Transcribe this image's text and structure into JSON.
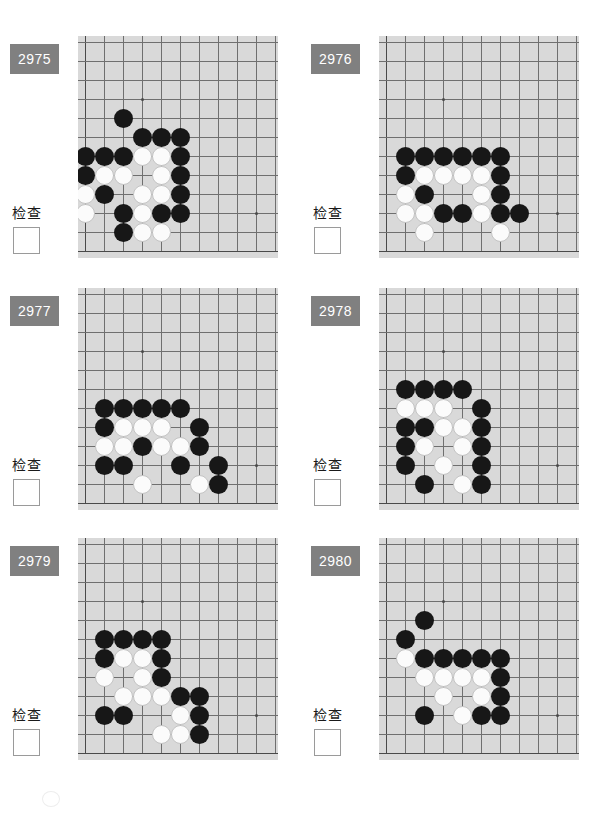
{
  "page": {
    "check_label": "检查",
    "board_bg_color": "#d9d9d9",
    "grid_line_color": "#6f6f6f",
    "badge_color": "#808080",
    "black_stone_color": "#171717",
    "white_stone_color": "#fbfbfb"
  },
  "board_geometry": {
    "columns": 10,
    "rows": 11,
    "cell_size": 19,
    "origin_x": 7,
    "origin_y": 6,
    "hoshi": [
      {
        "col": 3,
        "row": 3
      },
      {
        "col": 9,
        "row": 9
      }
    ],
    "note": "Upper-left corner of a full Go board; col 0 / row 0 are the board edges shown, bottom-left region drawn with the left and bottom boundary lines."
  },
  "problems": [
    {
      "id": "2975",
      "number_label": "2975",
      "check_label": "检查",
      "checkbox_checked": false,
      "stones": [
        {
          "color": "b",
          "col": 2,
          "row": 4
        },
        {
          "color": "b",
          "col": 3,
          "row": 5
        },
        {
          "color": "b",
          "col": 4,
          "row": 5
        },
        {
          "color": "b",
          "col": 5,
          "row": 5
        },
        {
          "color": "b",
          "col": 0,
          "row": 6
        },
        {
          "color": "b",
          "col": 1,
          "row": 6
        },
        {
          "color": "b",
          "col": 2,
          "row": 6
        },
        {
          "color": "w",
          "col": 3,
          "row": 6
        },
        {
          "color": "w",
          "col": 4,
          "row": 6
        },
        {
          "color": "b",
          "col": 5,
          "row": 6
        },
        {
          "color": "b",
          "col": 0,
          "row": 7
        },
        {
          "color": "w",
          "col": 1,
          "row": 7
        },
        {
          "color": "w",
          "col": 2,
          "row": 7
        },
        {
          "color": "w",
          "col": 4,
          "row": 7
        },
        {
          "color": "b",
          "col": 5,
          "row": 7
        },
        {
          "color": "w",
          "col": 0,
          "row": 8
        },
        {
          "color": "b",
          "col": 1,
          "row": 8
        },
        {
          "color": "w",
          "col": 3,
          "row": 8
        },
        {
          "color": "w",
          "col": 4,
          "row": 8
        },
        {
          "color": "b",
          "col": 5,
          "row": 8
        },
        {
          "color": "w",
          "col": 0,
          "row": 9
        },
        {
          "color": "b",
          "col": 2,
          "row": 9
        },
        {
          "color": "w",
          "col": 3,
          "row": 9
        },
        {
          "color": "b",
          "col": 4,
          "row": 9
        },
        {
          "color": "b",
          "col": 5,
          "row": 9
        },
        {
          "color": "b",
          "col": 2,
          "row": 10
        },
        {
          "color": "w",
          "col": 3,
          "row": 10
        },
        {
          "color": "w",
          "col": 4,
          "row": 10
        }
      ]
    },
    {
      "id": "2976",
      "number_label": "2976",
      "check_label": "检查",
      "checkbox_checked": false,
      "stones": [
        {
          "color": "b",
          "col": 1,
          "row": 6
        },
        {
          "color": "b",
          "col": 2,
          "row": 6
        },
        {
          "color": "b",
          "col": 3,
          "row": 6
        },
        {
          "color": "b",
          "col": 4,
          "row": 6
        },
        {
          "color": "b",
          "col": 5,
          "row": 6
        },
        {
          "color": "b",
          "col": 6,
          "row": 6
        },
        {
          "color": "b",
          "col": 1,
          "row": 7
        },
        {
          "color": "w",
          "col": 2,
          "row": 7
        },
        {
          "color": "w",
          "col": 3,
          "row": 7
        },
        {
          "color": "w",
          "col": 4,
          "row": 7
        },
        {
          "color": "w",
          "col": 5,
          "row": 7
        },
        {
          "color": "b",
          "col": 6,
          "row": 7
        },
        {
          "color": "w",
          "col": 1,
          "row": 8
        },
        {
          "color": "b",
          "col": 2,
          "row": 8
        },
        {
          "color": "w",
          "col": 5,
          "row": 8
        },
        {
          "color": "b",
          "col": 6,
          "row": 8
        },
        {
          "color": "w",
          "col": 1,
          "row": 9
        },
        {
          "color": "w",
          "col": 2,
          "row": 9
        },
        {
          "color": "b",
          "col": 3,
          "row": 9
        },
        {
          "color": "b",
          "col": 4,
          "row": 9
        },
        {
          "color": "w",
          "col": 5,
          "row": 9
        },
        {
          "color": "b",
          "col": 6,
          "row": 9
        },
        {
          "color": "b",
          "col": 7,
          "row": 9
        },
        {
          "color": "w",
          "col": 2,
          "row": 10
        },
        {
          "color": "w",
          "col": 6,
          "row": 10
        }
      ]
    },
    {
      "id": "2977",
      "number_label": "2977",
      "check_label": "检查",
      "checkbox_checked": false,
      "stones": [
        {
          "color": "b",
          "col": 1,
          "row": 6
        },
        {
          "color": "b",
          "col": 2,
          "row": 6
        },
        {
          "color": "b",
          "col": 3,
          "row": 6
        },
        {
          "color": "b",
          "col": 4,
          "row": 6
        },
        {
          "color": "b",
          "col": 5,
          "row": 6
        },
        {
          "color": "b",
          "col": 1,
          "row": 7
        },
        {
          "color": "w",
          "col": 2,
          "row": 7
        },
        {
          "color": "w",
          "col": 3,
          "row": 7
        },
        {
          "color": "w",
          "col": 4,
          "row": 7
        },
        {
          "color": "b",
          "col": 6,
          "row": 7
        },
        {
          "color": "w",
          "col": 1,
          "row": 8
        },
        {
          "color": "w",
          "col": 2,
          "row": 8
        },
        {
          "color": "b",
          "col": 3,
          "row": 8
        },
        {
          "color": "w",
          "col": 4,
          "row": 8
        },
        {
          "color": "w",
          "col": 5,
          "row": 8
        },
        {
          "color": "b",
          "col": 6,
          "row": 8
        },
        {
          "color": "b",
          "col": 1,
          "row": 9
        },
        {
          "color": "b",
          "col": 2,
          "row": 9
        },
        {
          "color": "b",
          "col": 5,
          "row": 9
        },
        {
          "color": "b",
          "col": 7,
          "row": 9
        },
        {
          "color": "w",
          "col": 3,
          "row": 10
        },
        {
          "color": "w",
          "col": 6,
          "row": 10
        },
        {
          "color": "b",
          "col": 7,
          "row": 10
        }
      ]
    },
    {
      "id": "2978",
      "number_label": "2978",
      "check_label": "检查",
      "checkbox_checked": false,
      "stones": [
        {
          "color": "b",
          "col": 1,
          "row": 5
        },
        {
          "color": "b",
          "col": 2,
          "row": 5
        },
        {
          "color": "b",
          "col": 3,
          "row": 5
        },
        {
          "color": "b",
          "col": 4,
          "row": 5
        },
        {
          "color": "w",
          "col": 1,
          "row": 6
        },
        {
          "color": "w",
          "col": 2,
          "row": 6
        },
        {
          "color": "w",
          "col": 3,
          "row": 6
        },
        {
          "color": "b",
          "col": 5,
          "row": 6
        },
        {
          "color": "b",
          "col": 1,
          "row": 7
        },
        {
          "color": "b",
          "col": 2,
          "row": 7
        },
        {
          "color": "w",
          "col": 3,
          "row": 7
        },
        {
          "color": "w",
          "col": 4,
          "row": 7
        },
        {
          "color": "b",
          "col": 5,
          "row": 7
        },
        {
          "color": "b",
          "col": 1,
          "row": 8
        },
        {
          "color": "w",
          "col": 2,
          "row": 8
        },
        {
          "color": "w",
          "col": 4,
          "row": 8
        },
        {
          "color": "b",
          "col": 5,
          "row": 8
        },
        {
          "color": "b",
          "col": 1,
          "row": 9
        },
        {
          "color": "w",
          "col": 3,
          "row": 9
        },
        {
          "color": "b",
          "col": 5,
          "row": 9
        },
        {
          "color": "b",
          "col": 2,
          "row": 10
        },
        {
          "color": "w",
          "col": 4,
          "row": 10
        },
        {
          "color": "b",
          "col": 5,
          "row": 10
        }
      ]
    },
    {
      "id": "2979",
      "number_label": "2979",
      "check_label": "检查",
      "checkbox_checked": false,
      "stones": [
        {
          "color": "b",
          "col": 1,
          "row": 5
        },
        {
          "color": "b",
          "col": 2,
          "row": 5
        },
        {
          "color": "b",
          "col": 3,
          "row": 5
        },
        {
          "color": "b",
          "col": 4,
          "row": 5
        },
        {
          "color": "b",
          "col": 1,
          "row": 6
        },
        {
          "color": "w",
          "col": 2,
          "row": 6
        },
        {
          "color": "w",
          "col": 3,
          "row": 6
        },
        {
          "color": "b",
          "col": 4,
          "row": 6
        },
        {
          "color": "w",
          "col": 1,
          "row": 7
        },
        {
          "color": "w",
          "col": 3,
          "row": 7
        },
        {
          "color": "b",
          "col": 4,
          "row": 7
        },
        {
          "color": "w",
          "col": 2,
          "row": 8
        },
        {
          "color": "w",
          "col": 3,
          "row": 8
        },
        {
          "color": "w",
          "col": 4,
          "row": 8
        },
        {
          "color": "b",
          "col": 5,
          "row": 8
        },
        {
          "color": "b",
          "col": 6,
          "row": 8
        },
        {
          "color": "b",
          "col": 1,
          "row": 9
        },
        {
          "color": "b",
          "col": 2,
          "row": 9
        },
        {
          "color": "w",
          "col": 5,
          "row": 9
        },
        {
          "color": "b",
          "col": 6,
          "row": 9
        },
        {
          "color": "w",
          "col": 4,
          "row": 10
        },
        {
          "color": "w",
          "col": 5,
          "row": 10
        },
        {
          "color": "b",
          "col": 6,
          "row": 10
        }
      ]
    },
    {
      "id": "2980",
      "number_label": "2980",
      "check_label": "检查",
      "checkbox_checked": false,
      "stones": [
        {
          "color": "b",
          "col": 2,
          "row": 4
        },
        {
          "color": "b",
          "col": 1,
          "row": 5
        },
        {
          "color": "w",
          "col": 1,
          "row": 6
        },
        {
          "color": "b",
          "col": 2,
          "row": 6
        },
        {
          "color": "b",
          "col": 3,
          "row": 6
        },
        {
          "color": "b",
          "col": 4,
          "row": 6
        },
        {
          "color": "b",
          "col": 5,
          "row": 6
        },
        {
          "color": "b",
          "col": 6,
          "row": 6
        },
        {
          "color": "w",
          "col": 2,
          "row": 7
        },
        {
          "color": "w",
          "col": 3,
          "row": 7
        },
        {
          "color": "w",
          "col": 4,
          "row": 7
        },
        {
          "color": "w",
          "col": 5,
          "row": 7
        },
        {
          "color": "b",
          "col": 6,
          "row": 7
        },
        {
          "color": "w",
          "col": 3,
          "row": 8
        },
        {
          "color": "w",
          "col": 5,
          "row": 8
        },
        {
          "color": "b",
          "col": 6,
          "row": 8
        },
        {
          "color": "b",
          "col": 2,
          "row": 9
        },
        {
          "color": "w",
          "col": 4,
          "row": 9
        },
        {
          "color": "b",
          "col": 5,
          "row": 9
        },
        {
          "color": "b",
          "col": 6,
          "row": 9
        }
      ]
    }
  ]
}
